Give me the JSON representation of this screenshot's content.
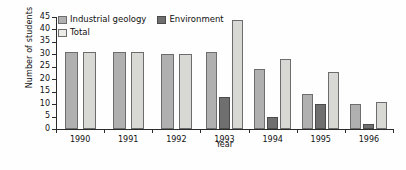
{
  "chart_data": {
    "type": "bar",
    "title": "",
    "xlabel": "Year",
    "ylabel": "Number of students",
    "categories": [
      "1990",
      "1991",
      "1992",
      "1993",
      "1994",
      "1995",
      "1996"
    ],
    "ylim": [
      0,
      45
    ],
    "yticks": [
      0,
      5,
      10,
      15,
      20,
      25,
      30,
      35,
      40,
      45
    ],
    "grid": false,
    "legend_position": "top-left",
    "series": [
      {
        "name": "Industrial geology",
        "color": "#b0b0b0",
        "values": [
          31,
          31,
          30,
          31,
          24,
          14,
          10
        ]
      },
      {
        "name": "Environment",
        "color": "#6f6f6f",
        "values": [
          null,
          null,
          null,
          13,
          5,
          10,
          2
        ]
      },
      {
        "name": "Total",
        "color": "#d8d8d4",
        "values": [
          31,
          31,
          30,
          44,
          28,
          23,
          11
        ]
      }
    ]
  },
  "legend": {
    "items": [
      {
        "label": "Industrial geology",
        "swatch": "series-ig"
      },
      {
        "label": "Environment",
        "swatch": "series-env"
      },
      {
        "label": "Total",
        "swatch": "series-tot"
      }
    ]
  }
}
